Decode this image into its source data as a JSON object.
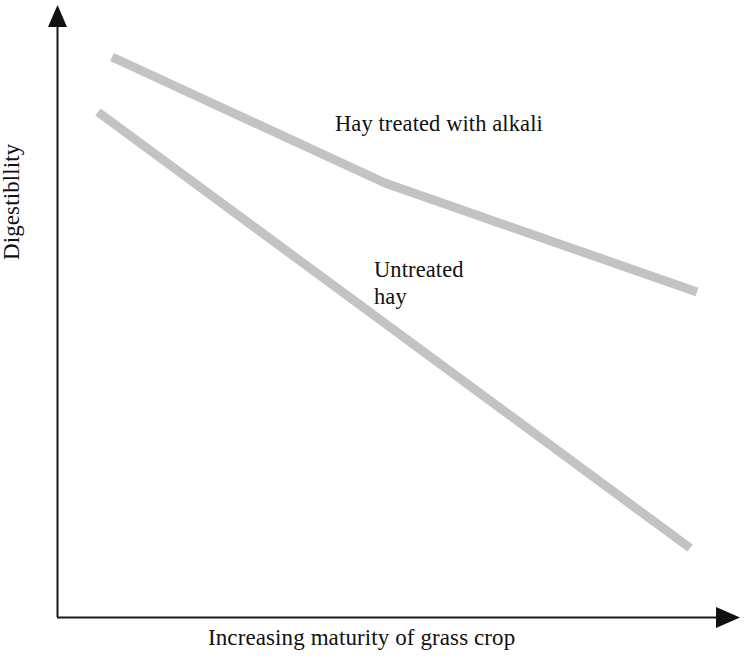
{
  "figure": {
    "background_color": "#ffffff",
    "axis_color": "#1a1a1a",
    "text_color": "#111111"
  },
  "axes": {
    "y_label": "Digestibllity",
    "x_label": "Increasing maturity of grass crop",
    "y_axis_name": "y-axis-arrow",
    "x_axis_name": "x-axis-arrow"
  },
  "series_labels": {
    "alkali": "Hay treated with alkali",
    "untreated_line1": "Untreated",
    "untreated_line2": "hay"
  },
  "chart_data": {
    "type": "line",
    "title": "",
    "subtitle": "",
    "xlabel": "Increasing maturity of grass crop",
    "ylabel": "Digestibllity",
    "xlim": [
      0,
      100
    ],
    "ylim": [
      0,
      100
    ],
    "grid": false,
    "axis_ticks": false,
    "tick_labels": false,
    "legend": "inline-annotations",
    "legend_position": "inline",
    "line_color": "#c3c3c1",
    "line_width_px": 9,
    "annotations": [
      {
        "text": "Hay treated with alkali",
        "attached_to": "Hay treated with alkali",
        "x_frac": 0.41,
        "y_frac": 0.81
      },
      {
        "text": "Untreated hay",
        "attached_to": "Untreated hay",
        "x_frac": 0.47,
        "y_frac": 0.56
      }
    ],
    "series": [
      {
        "name": "Hay treated with alkali",
        "color": "#c3c3c1",
        "x": [
          8,
          48,
          94
        ],
        "y": [
          92,
          79,
          58
        ],
        "points_px": [
          [
            112,
            57
          ],
          [
            385,
            183
          ],
          [
            697,
            292
          ]
        ],
        "description": "Gently declining line, slightly steeper in the first half then shallower; the higher of the two lines across the whole range."
      },
      {
        "name": "Untreated hay",
        "color": "#c3c3c1",
        "x": [
          6,
          93
        ],
        "y": [
          83,
          12
        ],
        "points_px": [
          [
            98,
            112
          ],
          [
            690,
            548
          ]
        ],
        "description": "Steeply declining straight line falling well below the alkali-treated line as maturity increases."
      }
    ],
    "reading": "Digestibility falls as the grass crop matures for both treatments, but hay treated with alkali declines far less steeply and stays more digestible than untreated hay at every stage of maturity."
  }
}
